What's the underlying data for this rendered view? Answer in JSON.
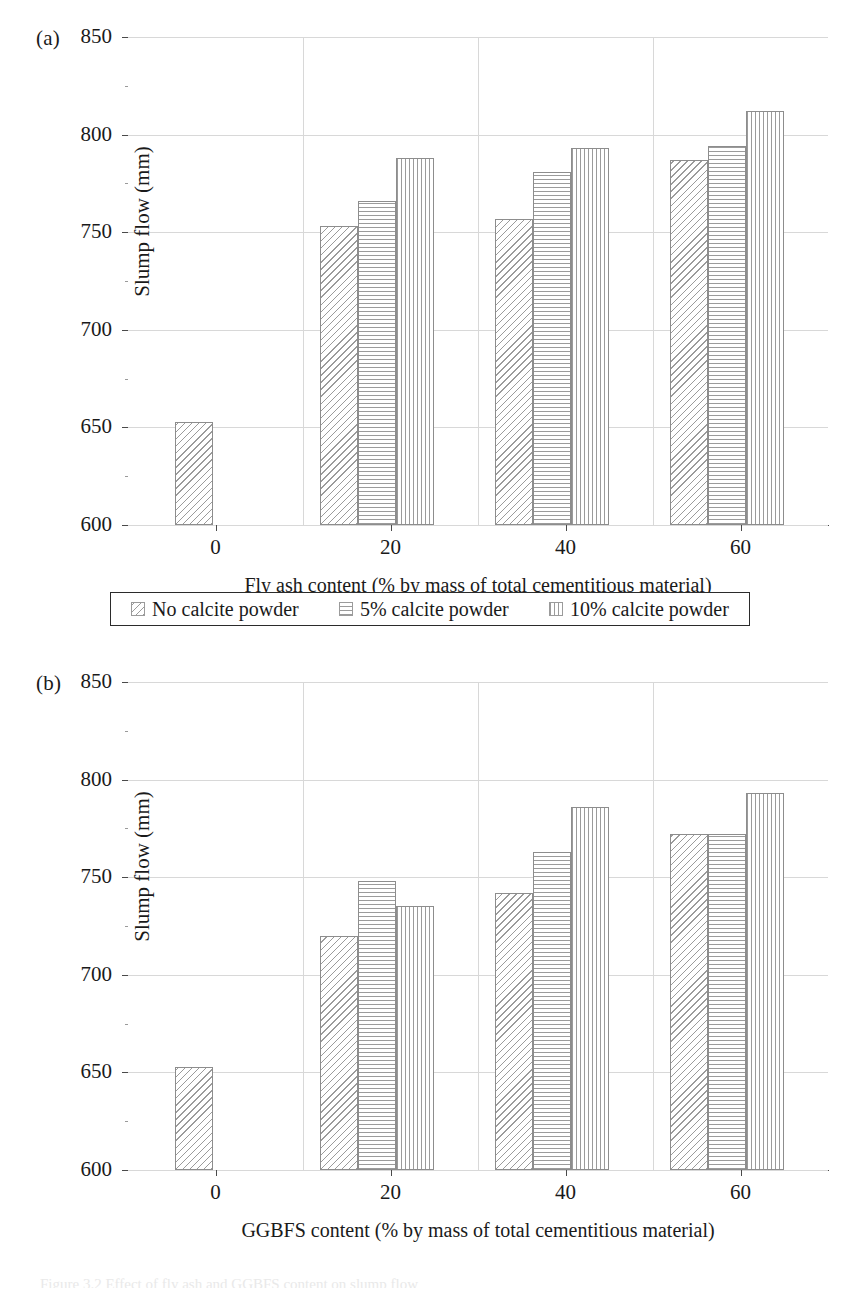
{
  "figure": {
    "panel_a_tag": "(a)",
    "panel_b_tag": "(b)",
    "caption_partial": "Figure 3.2 Effect of fly ash and GGBFS content on slump flow"
  },
  "legend": {
    "items": [
      {
        "label": "No calcite powder",
        "pattern": "diagonal-hatch",
        "swatch": "legend-swatch-no-calcite"
      },
      {
        "label": "5% calcite powder",
        "pattern": "horizontal-lines",
        "swatch": "legend-swatch-5pct"
      },
      {
        "label": "10% calcite powder",
        "pattern": "vertical-lines",
        "swatch": "legend-swatch-10pct"
      }
    ]
  },
  "axis": {
    "y_label": "Slump flow (mm)",
    "y_ticks": [
      "600",
      "650",
      "700",
      "750",
      "800",
      "850"
    ],
    "x_ticks": [
      "0",
      "20",
      "40",
      "60"
    ],
    "x_label_a": "Fly ash content (% by mass of total cementitious material)",
    "x_label_b": "GGBFS content (% by mass of total cementitious material)"
  },
  "colors": {
    "axis": "#4a4a4a",
    "grid": "#d8d8d8",
    "bar_edge": "#8d8d8d",
    "bar_hatch": "#9b9b9b",
    "legend_border": "#2b2b2b",
    "text": "#1a1a1a"
  },
  "chart_data": [
    {
      "type": "bar",
      "id": "panel-a",
      "title": "(a)",
      "xlabel": "Fly ash content (% by mass of total cementitious material)",
      "ylabel": "Slump flow (mm)",
      "categories": [
        "0",
        "20",
        "40",
        "60"
      ],
      "ylim": [
        600,
        850
      ],
      "ytick_step": 50,
      "yticks": [
        600,
        650,
        700,
        750,
        800,
        850
      ],
      "grid": true,
      "legend_position": "below-axes",
      "series": [
        {
          "name": "No calcite powder",
          "pattern": "diagonal-hatch",
          "values": [
            653,
            753,
            757,
            787
          ]
        },
        {
          "name": "5% calcite powder",
          "pattern": "horizontal-lines",
          "values": [
            null,
            766,
            781,
            794
          ]
        },
        {
          "name": "10% calcite powder",
          "pattern": "vertical-lines",
          "values": [
            null,
            788,
            793,
            812
          ]
        }
      ]
    },
    {
      "type": "bar",
      "id": "panel-b",
      "title": "(b)",
      "xlabel": "GGBFS content (% by mass of total cementitious material)",
      "ylabel": "Slump flow (mm)",
      "categories": [
        "0",
        "20",
        "40",
        "60"
      ],
      "ylim": [
        600,
        850
      ],
      "ytick_step": 50,
      "yticks": [
        600,
        650,
        700,
        750,
        800,
        850
      ],
      "grid": true,
      "legend_position": "below-axes",
      "series": [
        {
          "name": "No calcite powder",
          "pattern": "diagonal-hatch",
          "values": [
            653,
            720,
            742,
            772
          ]
        },
        {
          "name": "5% calcite powder",
          "pattern": "horizontal-lines",
          "values": [
            null,
            748,
            763,
            772
          ]
        },
        {
          "name": "10% calcite powder",
          "pattern": "vertical-lines",
          "values": [
            null,
            735,
            786,
            793
          ]
        }
      ]
    }
  ]
}
